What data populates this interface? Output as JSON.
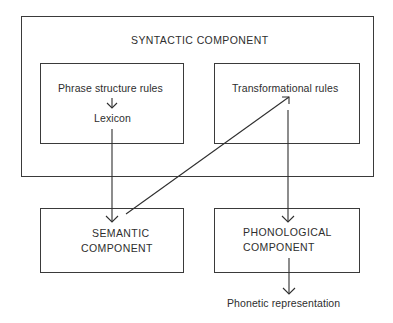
{
  "diagram": {
    "syntactic_component": {
      "title": "SYNTACTIC COMPONENT",
      "phrase_structure_box": {
        "top_label": "Phrase structure rules",
        "bottom_label": "Lexicon"
      },
      "transformational_box": {
        "label": "Transformational rules"
      }
    },
    "semantic_component": {
      "line1": "SEMANTIC",
      "line2": "COMPONENT"
    },
    "phonological_component": {
      "line1": "PHONOLOGICAL",
      "line2": "COMPONENT"
    },
    "output": {
      "label": "Phonetic representation"
    },
    "edges": [
      {
        "from": "Phrase structure rules",
        "to": "Lexicon"
      },
      {
        "from": "Lexicon",
        "to": "SEMANTIC COMPONENT"
      },
      {
        "from": "SEMANTIC COMPONENT",
        "to": "Transformational rules"
      },
      {
        "from": "Transformational rules",
        "to": "PHONOLOGICAL COMPONENT"
      },
      {
        "from": "PHONOLOGICAL COMPONENT",
        "to": "Phonetic representation"
      }
    ],
    "colors": {
      "line": "#2f2f2f",
      "background": "#ffffff"
    }
  }
}
